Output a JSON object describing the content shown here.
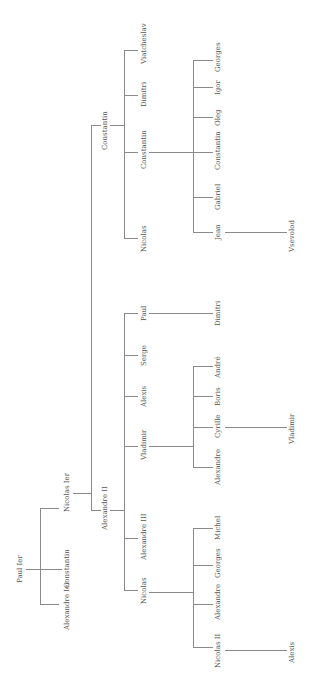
{
  "nodes": {
    "paul1": "Paul Ier",
    "alexandre1": "Alexandre Ier",
    "constantin_a": "Constantin",
    "nicolas1": "Nicolas Ier",
    "alexandre2": "Alexandre II",
    "constantin_b": "Constantin",
    "nicolas_a": "Nicolas",
    "alexandre3": "Alexandre III",
    "vladimir_a": "Vladimir",
    "alexis_a": "Alexis",
    "serge": "Serge",
    "paul_b": "Paul",
    "nicolas_b": "Nicolas",
    "constantin_c": "Constantin",
    "dimitri_a": "Dimitri",
    "viatcheslav": "Viatcheslav",
    "nicolas2": "Nicolas II",
    "alexandre_b": "Alexandre",
    "georges_a": "Georges",
    "michel": "Michel",
    "alexandre_c": "Alexandre",
    "cyrille": "Cyrille",
    "boris": "Boris",
    "andre": "André",
    "dimitri_b": "Dimitri",
    "jean": "Jean",
    "gabriel": "Gabriel",
    "constantin_d": "Constantin",
    "oleg": "Oleg",
    "igor": "Igor",
    "georges_b": "Georges",
    "alexis_b": "Alexis",
    "vladimir_b": "Vladimir",
    "vsevolod": "Vsevolod"
  }
}
